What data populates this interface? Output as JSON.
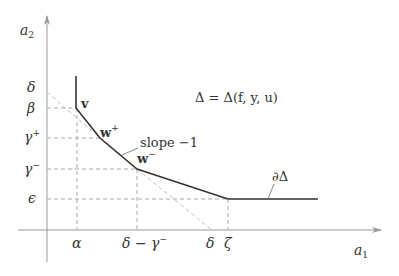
{
  "diagram": {
    "type": "newton-polygon",
    "axes": {
      "x_label": "a",
      "x_label_sub": "1",
      "y_label": "a",
      "y_label_sub": "2",
      "axis_color": "#999999"
    },
    "y_ticks": [
      {
        "id": "delta",
        "label": "δ",
        "sup": ""
      },
      {
        "id": "beta",
        "label": "β",
        "sup": ""
      },
      {
        "id": "gamma-plus",
        "label": "γ",
        "sup": "+"
      },
      {
        "id": "gamma-minus",
        "label": "γ",
        "sup": "−"
      },
      {
        "id": "epsilon",
        "label": "ϵ",
        "sup": ""
      }
    ],
    "x_ticks": [
      {
        "id": "alpha",
        "label": "α"
      },
      {
        "id": "delta-minus-gamma-minus",
        "label": "δ − γ",
        "sup": "−"
      },
      {
        "id": "delta",
        "label": "δ"
      },
      {
        "id": "zeta",
        "label": "ζ"
      }
    ],
    "vertices": [
      {
        "id": "v",
        "label": "v",
        "sup": ""
      },
      {
        "id": "w-plus",
        "label": "w",
        "sup": "+"
      },
      {
        "id": "w-minus",
        "label": "w",
        "sup": "−"
      }
    ],
    "annotations": {
      "polygon_def": "Δ = Δ(f, y, u)",
      "slope": "slope −1",
      "boundary": "∂Δ"
    },
    "colors": {
      "polygon": "#333333",
      "dashed": "#aaaaaa",
      "text": "#333333"
    }
  }
}
